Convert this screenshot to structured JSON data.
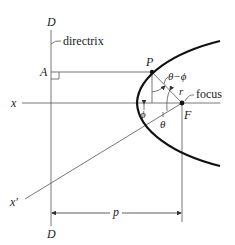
{
  "diagram": {
    "labels": {
      "directrix_top": "D",
      "directrix_bottom": "D",
      "directrix": "directrix",
      "point_a": "A",
      "point_p": "P",
      "axis_x": "x",
      "axis_x_prime": "x′",
      "focus": "focus",
      "point_f": "F",
      "radius": "r",
      "angle_theta_minus_phi": "θ−ϕ",
      "angle_phi": "ϕ",
      "angle_theta": "θ",
      "distance_p": "p"
    },
    "colors": {
      "curve": "#111111",
      "lines": "#555555",
      "text": "#222222"
    }
  }
}
